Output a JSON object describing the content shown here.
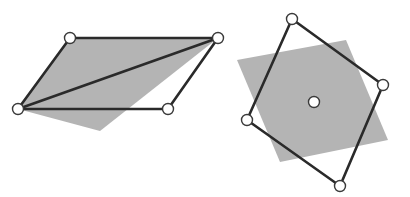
{
  "figure": {
    "width": 410,
    "height": 197,
    "colors": {
      "background": "#ffffff",
      "shade": "#b4b4b4",
      "edge": "#2a2a2a",
      "vertex_fill": "#ffffff",
      "vertex_stroke": "#3a3a3a"
    },
    "left_diagram": {
      "description": "parallelogram with diagonal over shaded triangle",
      "shaded_polygon": [
        [
          70,
          38
        ],
        [
          218,
          38
        ],
        [
          100,
          131
        ],
        [
          18,
          109
        ]
      ],
      "parallelogram": [
        [
          70,
          38
        ],
        [
          218,
          38
        ],
        [
          168,
          109
        ],
        [
          18,
          109
        ]
      ],
      "diagonal": [
        [
          18,
          109
        ],
        [
          218,
          38
        ]
      ],
      "vertices": [
        [
          70,
          38
        ],
        [
          218,
          38
        ],
        [
          168,
          109
        ],
        [
          18,
          109
        ]
      ]
    },
    "right_diagram": {
      "description": "rotated square outline over shaded square with center point",
      "shaded_polygon": [
        [
          237,
          60
        ],
        [
          346,
          40
        ],
        [
          388,
          140
        ],
        [
          280,
          162
        ]
      ],
      "quadrilateral": [
        [
          292,
          19
        ],
        [
          383,
          85
        ],
        [
          340,
          186
        ],
        [
          247,
          120
        ]
      ],
      "vertices": [
        [
          292,
          19
        ],
        [
          383,
          85
        ],
        [
          340,
          186
        ],
        [
          247,
          120
        ]
      ],
      "center": [
        314,
        102
      ]
    }
  }
}
